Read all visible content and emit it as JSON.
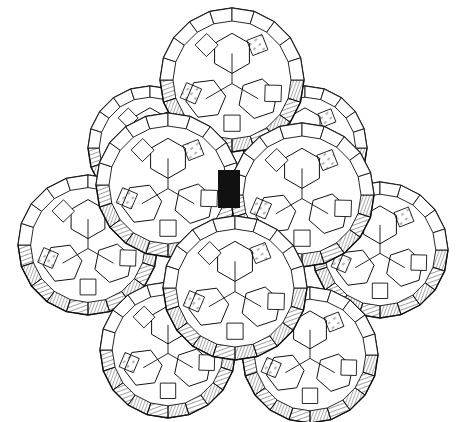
{
  "figure": {
    "background": "#ffffff",
    "ink": "#111111",
    "polyhedra": [
      {
        "id": "back-left",
        "cx": 150,
        "cy": 148,
        "r": 62
      },
      {
        "id": "back-right",
        "cx": 305,
        "cy": 148,
        "r": 62
      },
      {
        "id": "top",
        "cx": 232,
        "cy": 80,
        "r": 72
      },
      {
        "id": "left",
        "cx": 88,
        "cy": 245,
        "r": 70
      },
      {
        "id": "right",
        "cx": 380,
        "cy": 250,
        "r": 68
      },
      {
        "id": "front-left",
        "cx": 168,
        "cy": 185,
        "r": 72
      },
      {
        "id": "front-right",
        "cx": 302,
        "cy": 195,
        "r": 72
      },
      {
        "id": "bottom-left",
        "cx": 168,
        "cy": 350,
        "r": 68
      },
      {
        "id": "bottom-right",
        "cx": 310,
        "cy": 355,
        "r": 68
      },
      {
        "id": "center",
        "cx": 235,
        "cy": 288,
        "r": 72
      }
    ]
  }
}
